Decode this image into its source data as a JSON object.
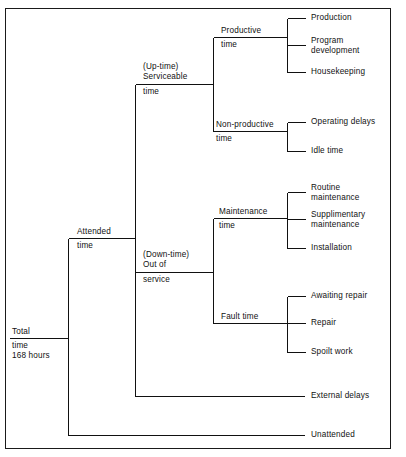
{
  "diagram": {
    "frame": {
      "border_color": "#1a1a1a",
      "background": "#ffffff"
    },
    "line_color": "#111111",
    "text_color": "#111111",
    "root": {
      "label_line1": "Total",
      "label_line2": "time",
      "label_line3": "168 hours",
      "hours": "168 hours"
    },
    "nodes": {
      "attended": {
        "label_above": "Attended",
        "label_below": "time"
      },
      "uptime": {
        "label_above_1": "(Up-time)",
        "label_above_2": "Serviceable",
        "label_below": "time"
      },
      "downtime": {
        "label_above_1": "(Down-time)",
        "label_above_2": "Out of",
        "label_below": "service"
      },
      "productive": {
        "label_above": "Productive",
        "label_below": "time"
      },
      "non_productive": {
        "label_above": "Non-productive",
        "label_below": "time"
      },
      "maintenance": {
        "label_above": "Maintenance",
        "label_below": "time"
      },
      "fault": {
        "label": "Fault time"
      }
    },
    "leaves": {
      "production": "Production",
      "program_development_1": "Program",
      "program_development_2": "development",
      "housekeeping": "Housekeeping",
      "operating_delays": "Operating delays",
      "idle_time": "Idle time",
      "routine_maintenance_1": "Routine",
      "routine_maintenance_2": "maintenance",
      "supplimentary_maintenance_1": "Supplimentary",
      "supplimentary_maintenance_2": "maintenance",
      "installation": "Installation",
      "awaiting_repair": "Awaiting repair",
      "repair": "Repair",
      "spoilt_work": "Spoilt work",
      "external_delays": "External delays",
      "unattended": "Unattended"
    }
  }
}
